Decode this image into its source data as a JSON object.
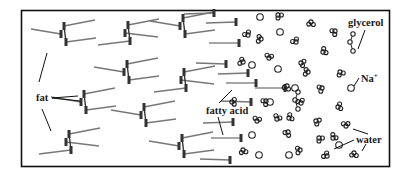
{
  "figure": {
    "colors": {
      "frame": "#111111",
      "tail": "#777777",
      "head": "#333333",
      "ring": "#222222",
      "leader": "#111111",
      "text": "#1a1a1a",
      "background": "#ffffff"
    }
  },
  "labels": {
    "fat": "fat",
    "fatty_acid": "fatty acid",
    "glycerol": "glycerol",
    "sodium": "Na",
    "sodium_charge": "+",
    "water": "water"
  },
  "legend_items": [
    {
      "key": "fat",
      "icon": "triglyceride-icon"
    },
    {
      "key": "fatty_acid",
      "icon": "fatty-acid-icon"
    },
    {
      "key": "glycerol",
      "icon": "glycerol-icon"
    },
    {
      "key": "sodium",
      "icon": "sodium-ion-icon"
    },
    {
      "key": "water",
      "icon": "water-molecule-icon"
    }
  ],
  "counts": {
    "fat_molecules": 10,
    "fatty_acids": 11,
    "glycerol_molecules": 2,
    "sodium_ions": 11,
    "water_molecules": 30
  }
}
